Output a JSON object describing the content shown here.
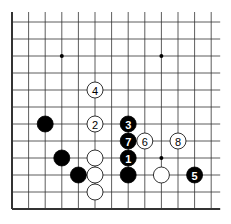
{
  "board": {
    "columns": 13,
    "rows": 12,
    "edges": [
      "left",
      "bottom"
    ],
    "hoshi": [
      [
        3,
        2
      ],
      [
        9,
        2
      ],
      [
        9,
        8
      ]
    ],
    "colors": {
      "black": "#000000",
      "white": "#ffffff",
      "line": "#333333"
    }
  },
  "stones": [
    {
      "col": 5,
      "row": 4,
      "color": "white",
      "label": "4"
    },
    {
      "col": 2,
      "row": 6,
      "color": "black",
      "label": ""
    },
    {
      "col": 5,
      "row": 6,
      "color": "white",
      "label": "2"
    },
    {
      "col": 7,
      "row": 6,
      "color": "black",
      "label": "3"
    },
    {
      "col": 7,
      "row": 7,
      "color": "black",
      "label": "7"
    },
    {
      "col": 8,
      "row": 7,
      "color": "white",
      "label": "6"
    },
    {
      "col": 10,
      "row": 7,
      "color": "white",
      "label": "8"
    },
    {
      "col": 3,
      "row": 8,
      "color": "black",
      "label": ""
    },
    {
      "col": 5,
      "row": 8,
      "color": "white",
      "label": ""
    },
    {
      "col": 7,
      "row": 8,
      "color": "black",
      "label": "1"
    },
    {
      "col": 4,
      "row": 9,
      "color": "black",
      "label": ""
    },
    {
      "col": 5,
      "row": 9,
      "color": "white",
      "label": ""
    },
    {
      "col": 7,
      "row": 9,
      "color": "black",
      "label": ""
    },
    {
      "col": 9,
      "row": 9,
      "color": "white",
      "label": ""
    },
    {
      "col": 11,
      "row": 9,
      "color": "black",
      "label": "5"
    },
    {
      "col": 5,
      "row": 10,
      "color": "white",
      "label": ""
    }
  ]
}
